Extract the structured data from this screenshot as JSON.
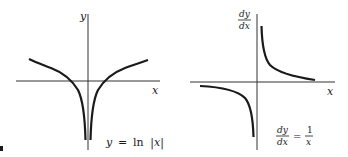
{
  "left_plot": {
    "y_axis_label": "y",
    "x_axis_label": "x",
    "equation_lhs": "y",
    "equation_eq": "=",
    "equation_fn": "ln",
    "equation_arg": "|x|"
  },
  "right_plot": {
    "y_axis_num": "dy",
    "y_axis_den": "dx",
    "x_axis_label": "x",
    "equation_num": "dy",
    "equation_den": "dx",
    "equation_eq": "=",
    "equation_rhs_num": "1",
    "equation_rhs_den": "x"
  },
  "colors": {
    "ink": "#1a1a1a",
    "background": "#ffffff"
  }
}
